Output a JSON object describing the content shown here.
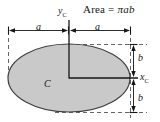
{
  "figure": {
    "type": "engineering-diagram",
    "title": {
      "prefix": "Area = ",
      "pi": "π",
      "semi_major": "a",
      "semi_minor": "b",
      "full": "Area = πab"
    },
    "labels": {
      "y_axis": "y",
      "y_axis_sub": "C",
      "x_axis": "x",
      "x_axis_sub": "C",
      "centroid": "C",
      "dim_a_left": "a",
      "dim_a_right": "a",
      "dim_b_top": "b",
      "dim_b_bottom": "b"
    },
    "colors": {
      "fill": "#c8c8c8",
      "outline": "#3a3a3a",
      "axis": "#161616",
      "dashed": "#555555",
      "background": "#ffffff",
      "text": "#161616"
    },
    "geometry": {
      "center_x": 69,
      "center_y": 78,
      "semi_axis_a_px": 61,
      "semi_axis_b_px": 34,
      "ellipse_left": 8,
      "ellipse_right": 130,
      "ellipse_top": 44,
      "ellipse_bottom": 112
    }
  }
}
